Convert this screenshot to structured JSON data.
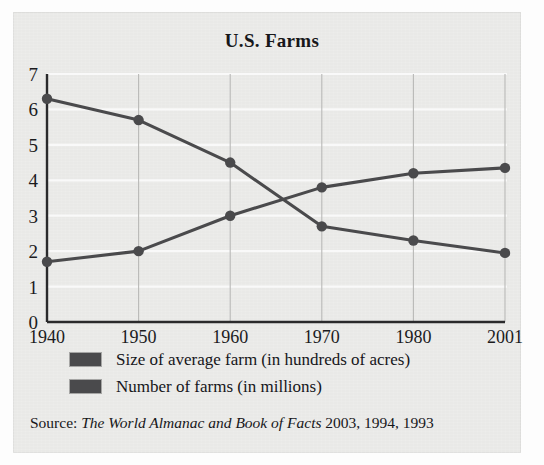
{
  "figure": {
    "title": "U.S. Farms",
    "panel_color": "#e9e9e7",
    "ink_color": "#4a4a4c"
  },
  "source": {
    "prefix": "Source:",
    "publication": "The World Almanac and Book of Facts",
    "years": "2003, 1994, 1993"
  },
  "legend": {
    "items": [
      {
        "label": "Size of average farm (in hundreds of acres)",
        "color": "#4a4a4c"
      },
      {
        "label": "Number of farms (in millions)",
        "color": "#4a4a4c"
      }
    ]
  },
  "axes": {
    "y_ticks": [
      "0",
      "1",
      "2",
      "3",
      "4",
      "5",
      "6",
      "7"
    ],
    "x_ticks": [
      "1940",
      "1950",
      "1960",
      "1970",
      "1980",
      "2001"
    ]
  },
  "chart_data": {
    "type": "line",
    "title": "U.S. Farms",
    "xlabel": "",
    "ylabel": "",
    "categories": [
      "1940",
      "1950",
      "1960",
      "1970",
      "1980",
      "2001"
    ],
    "x": [
      1940,
      1950,
      1960,
      1970,
      1980,
      2001
    ],
    "ylim": [
      0,
      7
    ],
    "yticks": [
      0,
      1,
      2,
      3,
      4,
      5,
      6,
      7
    ],
    "grid": "horizontal-and-vertical",
    "legend_position": "below-axes",
    "series": [
      {
        "name": "Size of average farm (in hundreds of acres)",
        "color": "#4a4a4c",
        "marker": "circle",
        "values": [
          1.7,
          2.0,
          3.0,
          3.8,
          4.2,
          4.35
        ]
      },
      {
        "name": "Number of farms (in millions)",
        "color": "#4a4a4c",
        "marker": "circle",
        "values": [
          6.3,
          5.7,
          4.5,
          2.7,
          2.3,
          1.95
        ]
      }
    ],
    "source": "Source: The World Almanac and Book of Facts 2003, 1994, 1993"
  }
}
